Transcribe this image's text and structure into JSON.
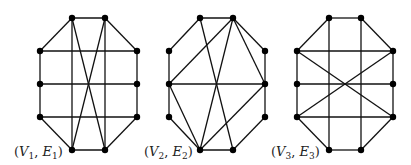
{
  "figure": {
    "graphs": [
      {
        "id": "g1",
        "label": {
          "open": "(",
          "v": "V",
          "vsub": "1",
          "sep": ", ",
          "e": "E",
          "esub": "1",
          "close": ")",
          "x": 14,
          "y": 156
        },
        "vertices": {
          "TL": [
            72,
            18
          ],
          "TR": [
            105,
            18
          ],
          "L1": [
            40,
            51
          ],
          "L2": [
            40,
            84
          ],
          "L3": [
            40,
            117
          ],
          "R1": [
            137,
            51
          ],
          "R2": [
            137,
            84
          ],
          "R3": [
            137,
            117
          ],
          "BL": [
            72,
            150
          ],
          "BR": [
            105,
            150
          ]
        },
        "edges": [
          [
            "TL",
            "TR"
          ],
          [
            "TL",
            "L1"
          ],
          [
            "TR",
            "R1"
          ],
          [
            "L1",
            "R1"
          ],
          [
            "L2",
            "R2"
          ],
          [
            "L3",
            "R3"
          ],
          [
            "L1",
            "L2"
          ],
          [
            "L2",
            "L3"
          ],
          [
            "R1",
            "R2"
          ],
          [
            "R2",
            "R3"
          ],
          [
            "L3",
            "BL"
          ],
          [
            "R3",
            "BR"
          ],
          [
            "BL",
            "BR"
          ],
          [
            "TL",
            "BL"
          ],
          [
            "TR",
            "BR"
          ],
          [
            "TL",
            "BR"
          ],
          [
            "TR",
            "BL"
          ]
        ]
      },
      {
        "id": "g2",
        "label": {
          "open": "(",
          "v": "V",
          "vsub": "2",
          "sep": ", ",
          "e": "E",
          "esub": "2",
          "close": ")",
          "x": 144,
          "y": 156
        },
        "vertices": {
          "TL": [
            200,
            18
          ],
          "TR": [
            233,
            18
          ],
          "L1": [
            169,
            51
          ],
          "L2": [
            169,
            84
          ],
          "L3": [
            169,
            117
          ],
          "R1": [
            265,
            51
          ],
          "R2": [
            265,
            84
          ],
          "R3": [
            265,
            117
          ],
          "BL": [
            200,
            150
          ],
          "BR": [
            233,
            150
          ]
        },
        "edges": [
          [
            "TL",
            "TR"
          ],
          [
            "TL",
            "L1"
          ],
          [
            "TL",
            "BR"
          ],
          [
            "TR",
            "L2"
          ],
          [
            "TR",
            "BL"
          ],
          [
            "TR",
            "R1"
          ],
          [
            "TR",
            "R2"
          ],
          [
            "L1",
            "L2"
          ],
          [
            "L2",
            "L3"
          ],
          [
            "R1",
            "R2"
          ],
          [
            "R2",
            "R3"
          ],
          [
            "L2",
            "R2"
          ],
          [
            "L2",
            "BL"
          ],
          [
            "L3",
            "BL"
          ],
          [
            "BL",
            "BR"
          ],
          [
            "BL",
            "R2"
          ],
          [
            "BR",
            "R3"
          ]
        ]
      },
      {
        "id": "g3",
        "label": {
          "open": "(",
          "v": "V",
          "vsub": "3",
          "sep": ", ",
          "e": "E",
          "esub": "3",
          "close": ")",
          "x": 271,
          "y": 156
        },
        "vertices": {
          "TL": [
            329,
            18
          ],
          "TR": [
            361,
            18
          ],
          "L1": [
            297,
            51
          ],
          "L2": [
            297,
            84
          ],
          "L3": [
            297,
            117
          ],
          "R1": [
            393,
            51
          ],
          "R2": [
            393,
            84
          ],
          "R3": [
            393,
            117
          ],
          "BL": [
            329,
            150
          ],
          "BR": [
            361,
            150
          ]
        },
        "edges": [
          [
            "TL",
            "TR"
          ],
          [
            "TL",
            "L1"
          ],
          [
            "TR",
            "R1"
          ],
          [
            "L1",
            "R1"
          ],
          [
            "L2",
            "R2"
          ],
          [
            "L3",
            "R3"
          ],
          [
            "L1",
            "L2"
          ],
          [
            "L2",
            "L3"
          ],
          [
            "R1",
            "R2"
          ],
          [
            "R2",
            "R3"
          ],
          [
            "L3",
            "BL"
          ],
          [
            "R3",
            "BR"
          ],
          [
            "BL",
            "BR"
          ],
          [
            "TL",
            "BL"
          ],
          [
            "TR",
            "BR"
          ],
          [
            "L1",
            "R3"
          ],
          [
            "R1",
            "L3"
          ]
        ]
      }
    ],
    "style": {
      "edge_color": "#111111",
      "vertex_color": "#000000",
      "vertex_radius": 3.2
    }
  }
}
